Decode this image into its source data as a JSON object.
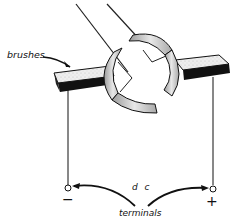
{
  "diagram": {
    "labels": {
      "brushes": "brushes",
      "dc": "d c",
      "terminals": "terminals",
      "negative": "−",
      "positive": "+"
    },
    "colors": {
      "ink": "#111111",
      "brush_top": "#e6e6e6",
      "segment_fill": "#cfcfcf",
      "background": "#ffffff"
    }
  }
}
